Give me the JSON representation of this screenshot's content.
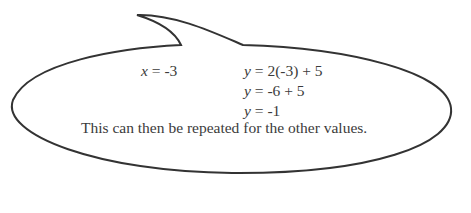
{
  "callout": {
    "shape": "speech-bubble",
    "stroke_color": "#333333",
    "fill_color": "#ffffff",
    "substitution": {
      "x_label": "x",
      "x_rest": " = -3"
    },
    "working": [
      {
        "var": "y",
        "expr": " = 2(-3) + 5"
      },
      {
        "var": "y",
        "expr": " = -6 + 5"
      },
      {
        "var": "y",
        "expr": " = -1"
      }
    ],
    "summary": "This can then be repeated for the other values."
  }
}
